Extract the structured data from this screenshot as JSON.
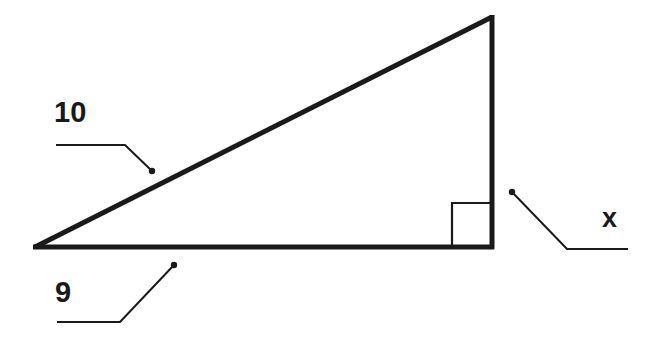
{
  "diagram": {
    "type": "right-triangle",
    "colors": {
      "stroke": "#1a1a1a",
      "background": "#ffffff"
    },
    "vertices": {
      "left": [
        35,
        247
      ],
      "top_right": [
        492,
        17
      ],
      "bottom_right": [
        492,
        247
      ]
    },
    "right_angle_marker": {
      "corner": "bottom_right",
      "size": 40
    },
    "sides": [
      {
        "name": "hypotenuse",
        "label": "10"
      },
      {
        "name": "base",
        "label": "9"
      },
      {
        "name": "vertical-leg",
        "label": "x"
      }
    ]
  }
}
